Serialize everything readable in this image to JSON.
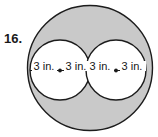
{
  "figure": {
    "problem_number": "16.",
    "shape_description": "large shaded circle containing two congruent white circles",
    "colors": {
      "outer_fill": "#c9c9c9",
      "inner_fill": "#ffffff",
      "stroke": "#1c1c1c",
      "page_background": "#ffffff",
      "text": "#161616"
    },
    "outer_circle": {
      "name": "outer-circle",
      "cx": 90,
      "cy": 68,
      "r": 63
    },
    "inner_circles": [
      {
        "name": "inner-circle-left",
        "cx": 60,
        "cy": 70,
        "r": 30
      },
      {
        "name": "inner-circle-right",
        "cx": 116,
        "cy": 70,
        "r": 30
      }
    ],
    "diameter_line": {
      "name": "diameter-line",
      "x1": 30,
      "y1": 70,
      "x2": 146,
      "y2": 70
    },
    "center_points": [
      {
        "name": "center-point-left",
        "cx": 60,
        "cy": 70,
        "r": 1.8
      },
      {
        "name": "center-point-right",
        "cx": 116,
        "cy": 70,
        "r": 1.8
      }
    ],
    "dimension_labels": [
      {
        "id": "left-circle-left-radius",
        "text": "3 in.",
        "x": 44,
        "y": 70
      },
      {
        "id": "left-circle-right-radius",
        "text": "3 in.",
        "x": 76,
        "y": 70
      },
      {
        "id": "right-circle-left-radius",
        "text": "3 in.",
        "x": 100,
        "y": 70
      },
      {
        "id": "right-circle-right-radius",
        "text": "3 in.",
        "x": 132,
        "y": 70
      }
    ]
  }
}
